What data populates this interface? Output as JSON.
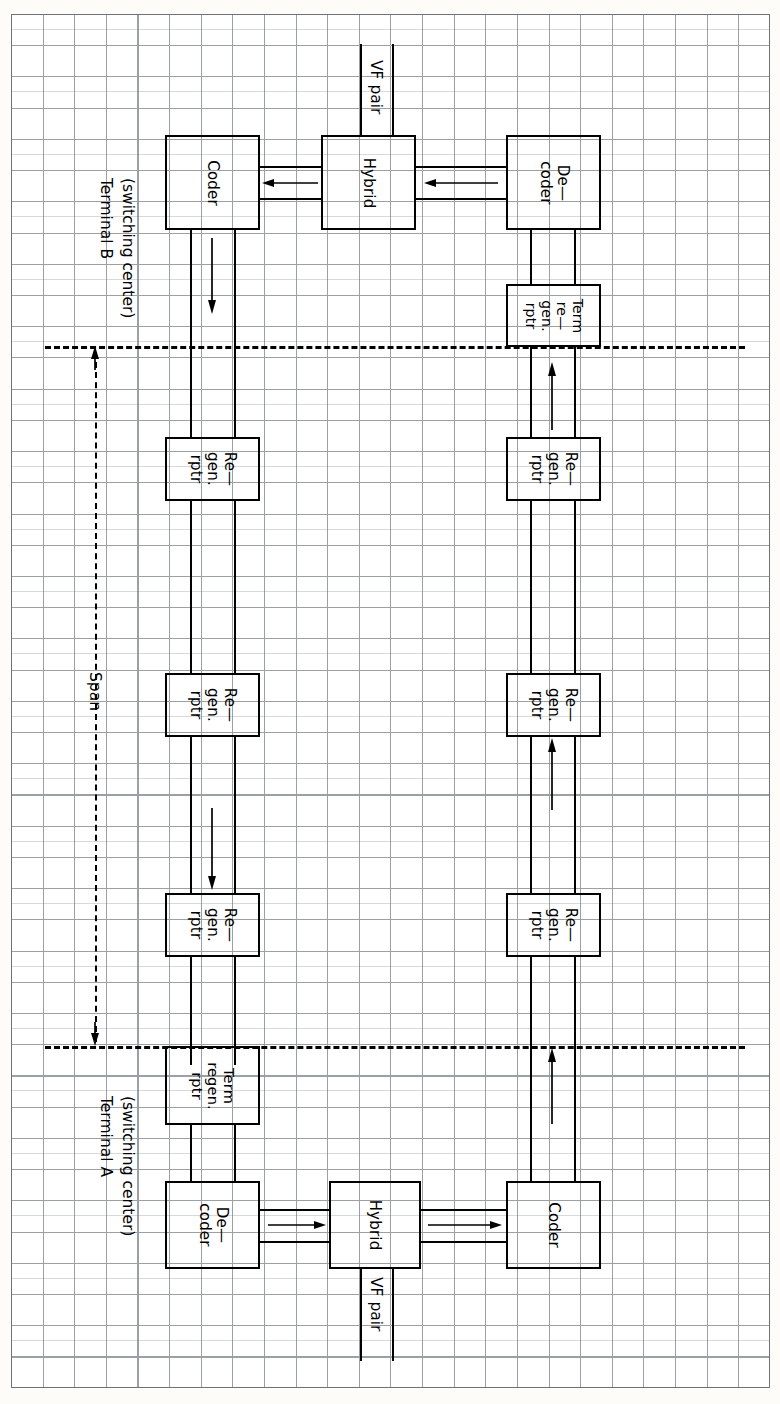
{
  "diagram": {
    "orientation": "rotated-90",
    "paper": {
      "type": "engineering graph paper",
      "grid_color": "#9aa0a6",
      "cell_px": 31
    },
    "labels": {
      "terminal_b": "Terminal B",
      "terminal_b_sub": "(switching center)",
      "terminal_a": "Terminal A",
      "terminal_a_sub": "(switching center)",
      "span": "Span",
      "vf_pair_top": "VF pair",
      "vf_pair_bottom": "VF pair"
    },
    "blocks": [
      {
        "id": "b-coder",
        "label": "Coder",
        "lines": [
          "Coder"
        ],
        "side": "terminal-b"
      },
      {
        "id": "b-hybrid",
        "label": "Hybrid",
        "lines": [
          "Hybrid"
        ],
        "side": "terminal-b"
      },
      {
        "id": "b-decoder",
        "label": "De-coder",
        "lines": [
          "De—",
          "coder"
        ],
        "side": "terminal-b"
      },
      {
        "id": "b-term-regen",
        "label": "Term re-gen. rptr",
        "lines": [
          "Term",
          "re—",
          "gen.",
          "rptr"
        ],
        "side": "terminal-b"
      },
      {
        "id": "left-regen-1",
        "label": "Re-gen. rptr",
        "lines": [
          "Re—",
          "gen.",
          "rptr"
        ],
        "side": "left-path"
      },
      {
        "id": "left-regen-2",
        "label": "Re-gen. rptr",
        "lines": [
          "Re—",
          "gen.",
          "rptr"
        ],
        "side": "left-path"
      },
      {
        "id": "left-regen-3",
        "label": "Re-gen. rptr",
        "lines": [
          "Re—",
          "gen.",
          "rptr"
        ],
        "side": "left-path"
      },
      {
        "id": "right-regen-1",
        "label": "Re-gen. rptr",
        "lines": [
          "Re—",
          "gen.",
          "rptr"
        ],
        "side": "right-path"
      },
      {
        "id": "right-regen-2",
        "label": "Re-gen. rptr",
        "lines": [
          "Re—",
          "gen.",
          "rptr"
        ],
        "side": "right-path"
      },
      {
        "id": "right-regen-3",
        "label": "Re-gen. rptr",
        "lines": [
          "Re—",
          "gen.",
          "rptr"
        ],
        "side": "right-path"
      },
      {
        "id": "a-term-regen",
        "label": "Term regen. rptr",
        "lines": [
          "Term",
          "regen.",
          "rptr"
        ],
        "side": "terminal-a"
      },
      {
        "id": "a-decoder",
        "label": "De-coder",
        "lines": [
          "De—",
          "coder"
        ],
        "side": "terminal-a"
      },
      {
        "id": "a-hybrid",
        "label": "Hybrid",
        "lines": [
          "Hybrid"
        ],
        "side": "terminal-a"
      },
      {
        "id": "a-coder",
        "label": "Coder",
        "lines": [
          "Coder"
        ],
        "side": "terminal-a"
      }
    ],
    "block_text": {
      "coder": "Coder",
      "hybrid": "Hybrid",
      "decoder_l1": "De—",
      "decoder_l2": "coder",
      "regen_l1": "Re—",
      "regen_l2": "gen.",
      "regen_l3": "rptr",
      "term_regen_b_l1": "Term",
      "term_regen_b_l2": "re—",
      "term_regen_b_l3": "gen.",
      "term_regen_b_l4": "rptr",
      "term_regen_a_l1": "Term",
      "term_regen_a_l2": "regen.",
      "term_regen_a_l3": "rptr"
    },
    "arrows": [
      {
        "id": "arrow-b-hybrid-to-coder",
        "direction": "left",
        "meaning": "VF signal into Coder at Terminal B"
      },
      {
        "id": "arrow-b-decoder-to-hybrid",
        "direction": "left",
        "meaning": "decoded signal to Hybrid at Terminal B"
      },
      {
        "id": "arrow-b-coder-down",
        "direction": "down",
        "meaning": "coded bit stream leaving Terminal B"
      },
      {
        "id": "arrow-left-path-down",
        "direction": "down",
        "meaning": "transmission toward Terminal A"
      },
      {
        "id": "arrow-right-path-up-1",
        "direction": "up",
        "meaning": "transmission toward Terminal B"
      },
      {
        "id": "arrow-right-path-up-2",
        "direction": "up",
        "meaning": "transmission toward Terminal B"
      },
      {
        "id": "arrow-right-path-up-3",
        "direction": "up",
        "meaning": "transmission toward Terminal B"
      },
      {
        "id": "arrow-a-decoder-to-hybrid",
        "direction": "right",
        "meaning": "decoded signal to Hybrid at Terminal A"
      },
      {
        "id": "arrow-a-hybrid-to-coder",
        "direction": "right",
        "meaning": "VF signal into Coder at Terminal A"
      },
      {
        "id": "arrow-span-up",
        "direction": "up",
        "meaning": "span extent upper end"
      },
      {
        "id": "arrow-span-down",
        "direction": "down",
        "meaning": "span extent lower end"
      }
    ],
    "colors": {
      "ink": "#000000",
      "grid": "#9aa0a6",
      "paper": "#ffffff"
    }
  }
}
